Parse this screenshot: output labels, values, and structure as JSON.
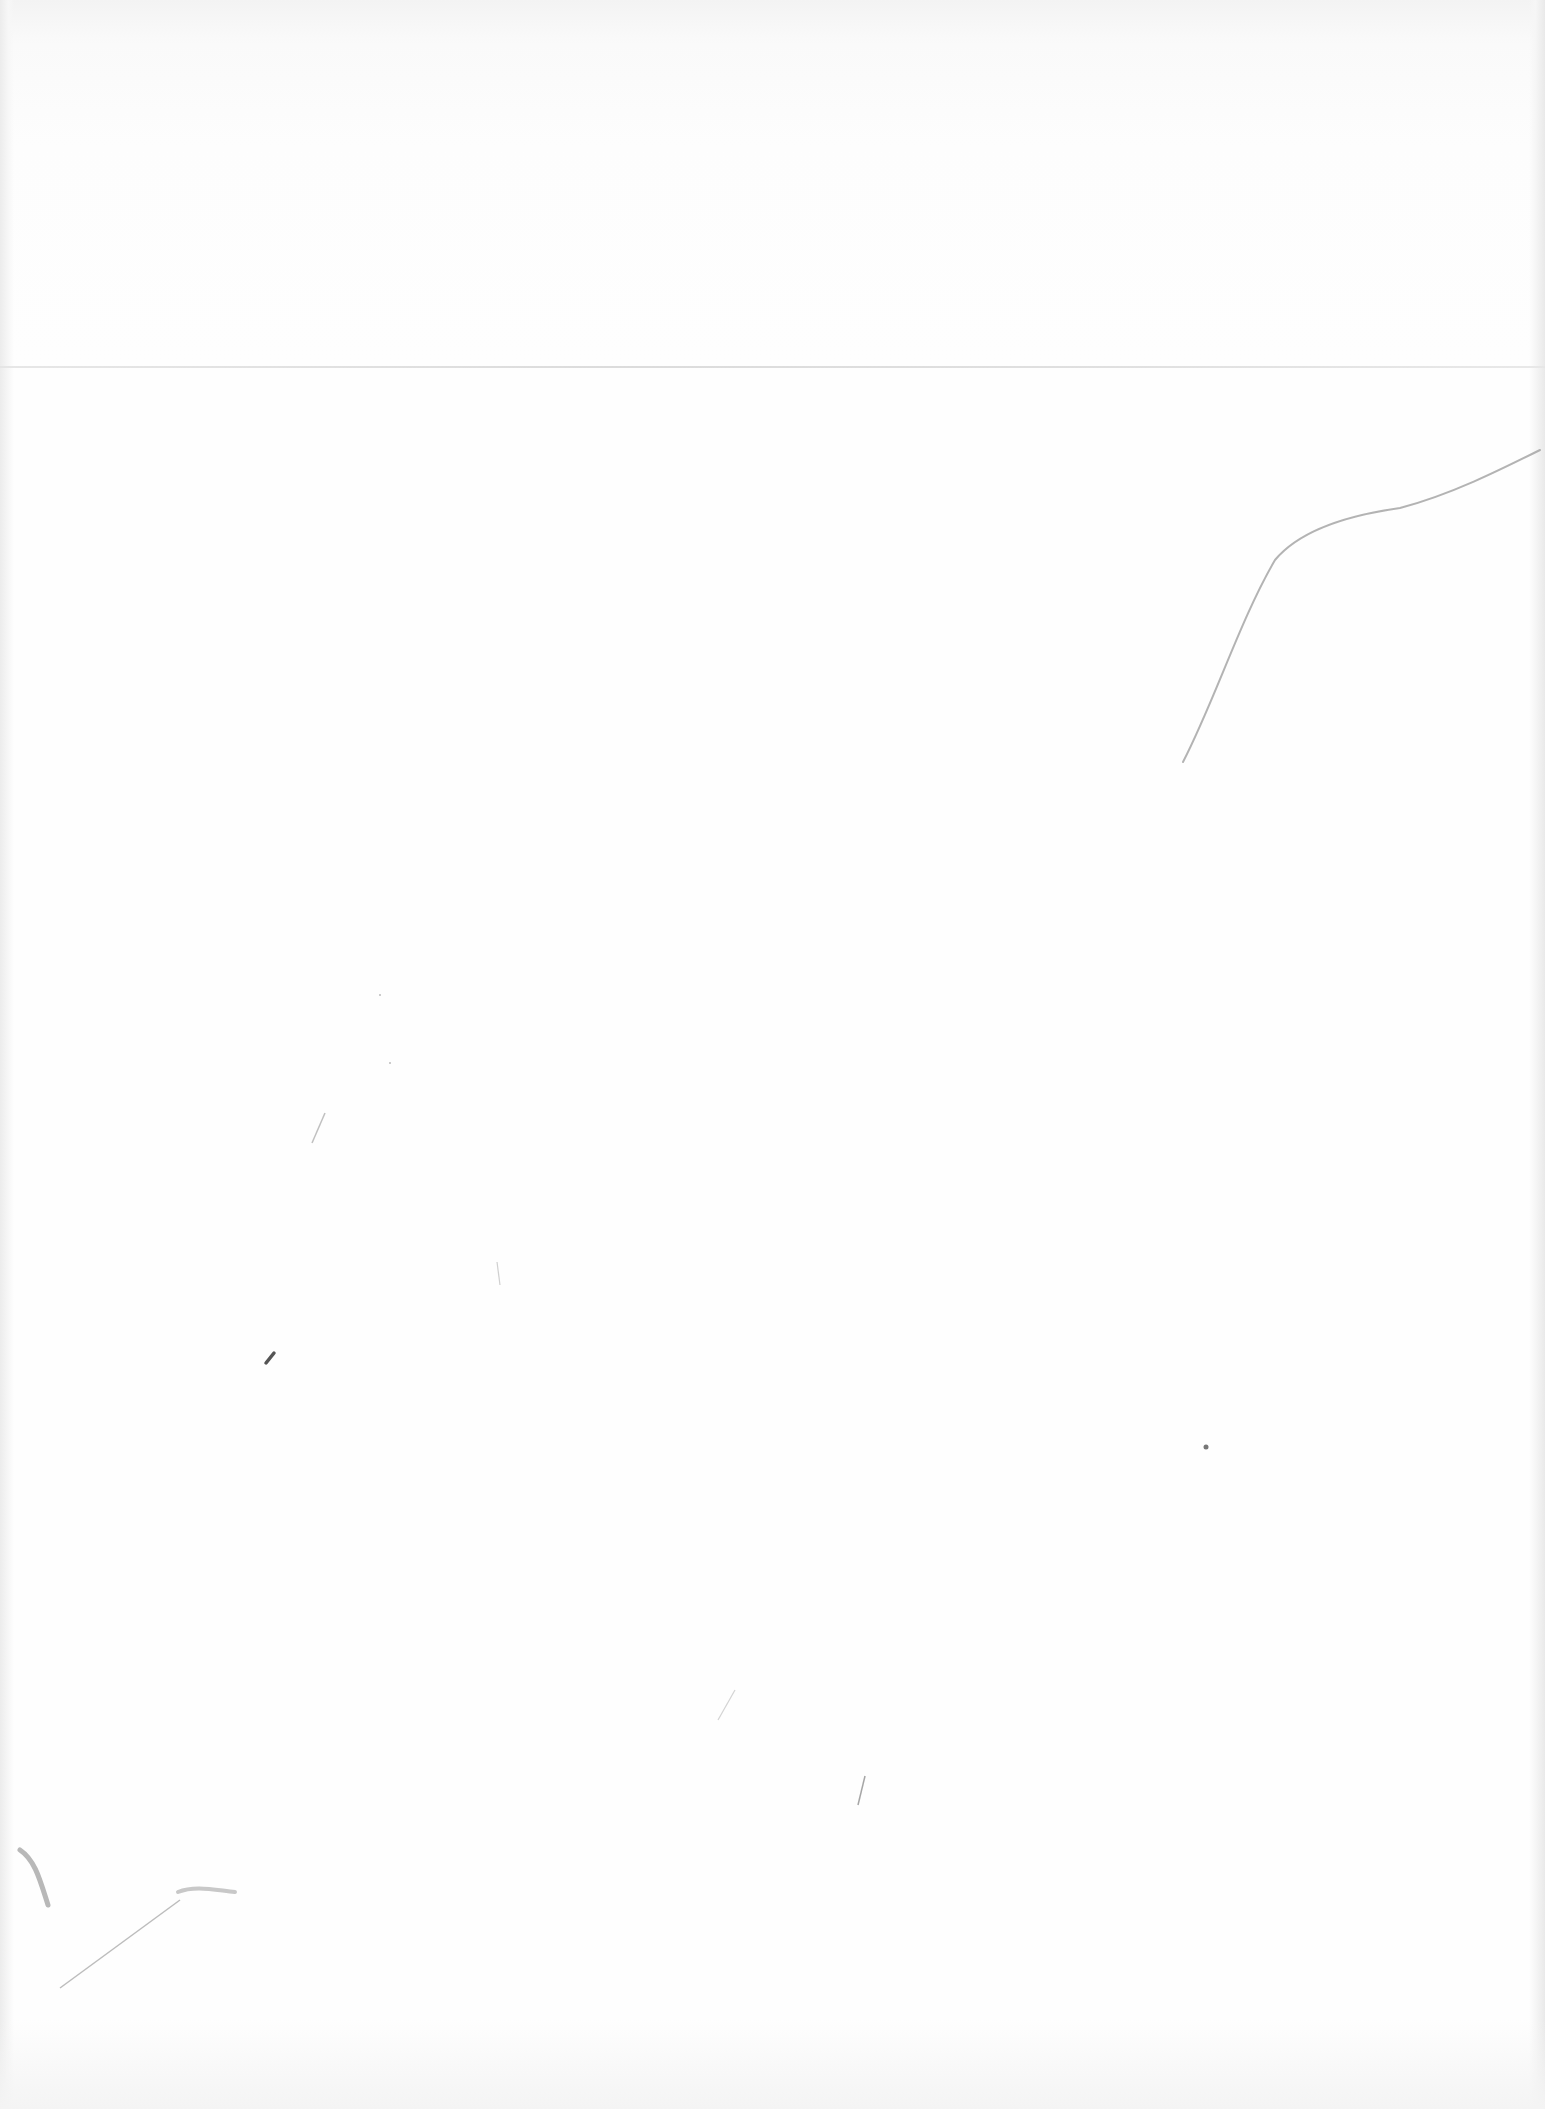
{
  "document": {
    "type": "blank scanned page",
    "text_content": ""
  },
  "colors": {
    "paper": "#fefefe",
    "fold_line": "#d8d8d8",
    "pencil_mark": "#8a8a8a"
  }
}
